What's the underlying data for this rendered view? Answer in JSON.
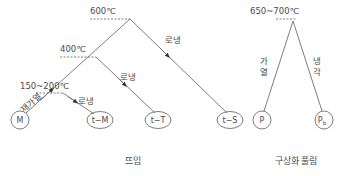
{
  "colors": {
    "line": "#6e6e6e",
    "text": "#4a4a4a",
    "background": "#ffffff"
  },
  "tempering": {
    "caption": "뜨임",
    "temps": {
      "t600": "600℃",
      "t400": "400℃",
      "t150_200": "150~200℃"
    },
    "actions": {
      "reheat": "재가열",
      "cool_600": "로냉",
      "cool_400": "로냉",
      "cool_150": "로냉"
    },
    "nodes": {
      "m": "M",
      "tm": "t−M",
      "tt": "t−T",
      "ts": "t−S"
    }
  },
  "spheroidizing": {
    "caption": "구상화 풀림",
    "temp": "650~700℃",
    "actions": {
      "heat": [
        "가",
        "열"
      ],
      "cool": [
        "냉",
        "각"
      ]
    },
    "nodes": {
      "p": "P",
      "pb_main": "P",
      "pb_sub": "b"
    }
  }
}
